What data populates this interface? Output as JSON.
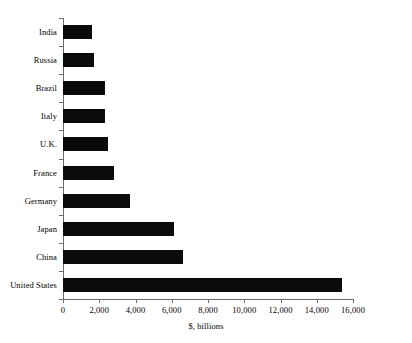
{
  "chart_data": {
    "type": "bar",
    "orientation": "horizontal",
    "title": "",
    "xlabel": "$, billions",
    "ylabel": "",
    "categories": [
      "India",
      "Russia",
      "Brazil",
      "Italy",
      "U.K.",
      "France",
      "Germany",
      "Japan",
      "China",
      "United States"
    ],
    "values": [
      1600,
      1700,
      2300,
      2300,
      2500,
      2800,
      3700,
      6100,
      6600,
      15400
    ],
    "xlim": [
      0,
      16000
    ],
    "xticks": [
      0,
      2000,
      4000,
      6000,
      8000,
      10000,
      12000,
      14000,
      16000
    ],
    "xtick_labels": [
      "0",
      "2,000",
      "4,000",
      "6,000",
      "8,000",
      "10,000",
      "12,000",
      "14,000",
      "16,000"
    ],
    "grid": false,
    "legend": false,
    "bar_color": "#0b0b0b",
    "axis_color": "#6d6d6d",
    "background": "#ffffff"
  },
  "axis": {
    "x_title": "$, billions"
  }
}
